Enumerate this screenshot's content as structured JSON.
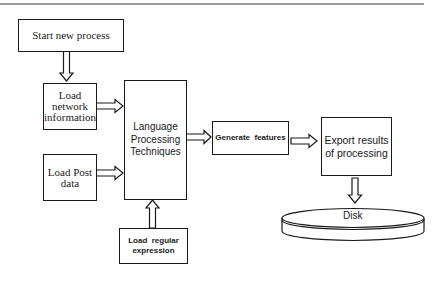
{
  "diagram": {
    "nodes": {
      "start": {
        "label": "Start new process"
      },
      "load_network": {
        "label_lines": [
          "Load",
          "network",
          "information"
        ]
      },
      "load_post": {
        "label_lines": [
          "Load Post",
          "data"
        ]
      },
      "lpt": {
        "label_lines": [
          "Language",
          "Processing",
          "Techniques"
        ]
      },
      "load_regex": {
        "label_lines": [
          "Load  regular",
          "expression"
        ]
      },
      "generate": {
        "label": "Generate  features"
      },
      "export": {
        "label_lines": [
          "Export results",
          "of processing"
        ]
      },
      "disk": {
        "label": "Disk"
      }
    },
    "edges": [
      {
        "from": "Start new process",
        "to": "Load network information",
        "style": "hollow-arrow"
      },
      {
        "from": "Load network information",
        "to": "Language Processing Techniques",
        "style": "hollow-arrow"
      },
      {
        "from": "Load Post data",
        "to": "Language Processing Techniques",
        "style": "hollow-arrow"
      },
      {
        "from": "Load regular expression",
        "to": "Language Processing Techniques",
        "style": "hollow-arrow"
      },
      {
        "from": "Language Processing Techniques",
        "to": "Generate features",
        "style": "hollow-arrow"
      },
      {
        "from": "Generate features",
        "to": "Export results of processing",
        "style": "hollow-arrow"
      },
      {
        "from": "Export results of processing",
        "to": "Disk",
        "style": "hollow-arrow"
      }
    ],
    "colors": {
      "stroke": "#1a1a1a",
      "background": "#ffffff",
      "top_rule": "#9a9a9a"
    }
  }
}
